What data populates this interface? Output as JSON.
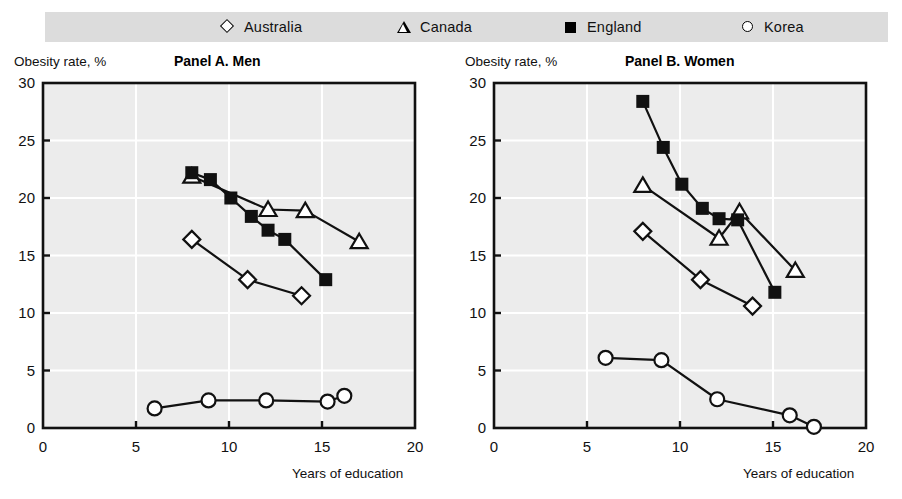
{
  "legend": {
    "background_color": "#dcdcdc",
    "items": [
      {
        "label": "Australia",
        "marker": "diamond-open-marker"
      },
      {
        "label": "Canada",
        "marker": "triangle-open-marker"
      },
      {
        "label": "England",
        "marker": "square-filled-marker"
      },
      {
        "label": "Korea",
        "marker": "circle-open-marker"
      }
    ]
  },
  "chart_data": [
    {
      "type": "scatter",
      "title": "Panel A. Men",
      "xlabel": "Years of education",
      "ylabel": "Obesity rate, %",
      "xlim": [
        0,
        20
      ],
      "ylim": [
        0,
        30
      ],
      "xticks": [
        0,
        5,
        10,
        15,
        20
      ],
      "yticks": [
        0,
        5,
        10,
        15,
        20,
        25,
        30
      ],
      "grid": true,
      "legend_position": "top",
      "series": [
        {
          "name": "Australia",
          "marker": "diamond-open-marker",
          "x": [
            8.0,
            11.0,
            13.9
          ],
          "y": [
            16.4,
            12.9,
            11.5
          ]
        },
        {
          "name": "Canada",
          "marker": "triangle-open-marker",
          "x": [
            8.0,
            12.1,
            14.1,
            17.0
          ],
          "y": [
            21.9,
            19.0,
            18.9,
            16.2
          ]
        },
        {
          "name": "England",
          "marker": "square-filled-marker",
          "x": [
            8.0,
            9.0,
            10.1,
            11.2,
            12.1,
            13.0,
            15.2
          ],
          "y": [
            22.2,
            21.6,
            20.0,
            18.4,
            17.2,
            16.4,
            12.9
          ]
        },
        {
          "name": "Korea",
          "marker": "circle-open-marker",
          "x": [
            6.0,
            8.9,
            12.0,
            15.3,
            16.2
          ],
          "y": [
            1.7,
            2.4,
            2.4,
            2.3,
            2.8
          ]
        }
      ]
    },
    {
      "type": "scatter",
      "title": "Panel B. Women",
      "xlabel": "Years of education",
      "ylabel": "Obesity rate, %",
      "xlim": [
        0,
        20
      ],
      "ylim": [
        0,
        30
      ],
      "xticks": [
        0,
        5,
        10,
        15,
        20
      ],
      "yticks": [
        0,
        5,
        10,
        15,
        20,
        25,
        30
      ],
      "grid": true,
      "legend_position": "top",
      "series": [
        {
          "name": "Australia",
          "marker": "diamond-open-marker",
          "x": [
            8.0,
            11.1,
            13.9
          ],
          "y": [
            17.1,
            12.9,
            10.6
          ]
        },
        {
          "name": "Canada",
          "marker": "triangle-open-marker",
          "x": [
            8.0,
            12.1,
            13.2,
            16.2
          ],
          "y": [
            21.1,
            16.5,
            18.8,
            13.7
          ]
        },
        {
          "name": "England",
          "marker": "square-filled-marker",
          "x": [
            8.0,
            9.1,
            10.1,
            11.2,
            12.1,
            13.1,
            15.1
          ],
          "y": [
            28.4,
            24.4,
            21.2,
            19.1,
            18.2,
            18.1,
            11.8
          ]
        },
        {
          "name": "Korea",
          "marker": "circle-open-marker",
          "x": [
            6.0,
            9.0,
            12.0,
            15.9,
            17.2
          ],
          "y": [
            6.1,
            5.9,
            2.5,
            1.1,
            0.1
          ]
        }
      ]
    }
  ]
}
